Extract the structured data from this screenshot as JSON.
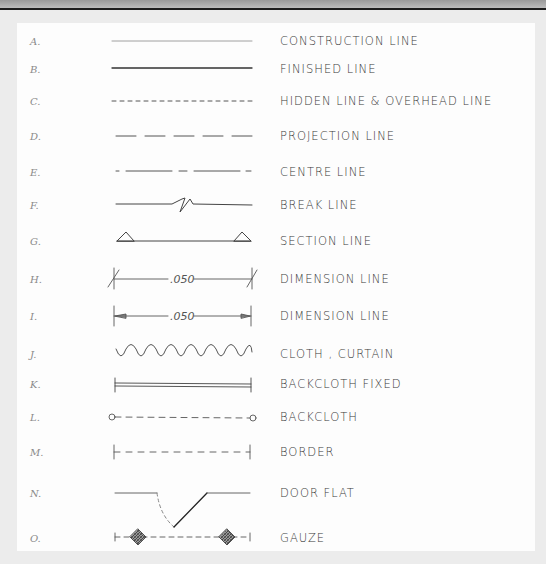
{
  "legend": {
    "rows": [
      {
        "letter": "A.",
        "label": "CONSTRUCTION LINE",
        "y": 41
      },
      {
        "letter": "B.",
        "label": "FINISHED LINE",
        "y": 69
      },
      {
        "letter": "C.",
        "label": "HIDDEN LINE & OVERHEAD LINE",
        "y": 101
      },
      {
        "letter": "D.",
        "label": "PROJECTION LINE",
        "y": 136
      },
      {
        "letter": "E.",
        "label": "CENTRE LINE",
        "y": 172
      },
      {
        "letter": "F.",
        "label": "BREAK LINE",
        "y": 205
      },
      {
        "letter": "G.",
        "label": "SECTION LINE",
        "y": 241
      },
      {
        "letter": "H.",
        "label": "DIMENSION LINE",
        "y": 279
      },
      {
        "letter": "I.",
        "label": "DIMENSION LINE",
        "y": 316
      },
      {
        "letter": "J.",
        "label": "CLOTH , CURTAIN",
        "y": 354
      },
      {
        "letter": "K.",
        "label": "BACKCLOTH FIXED",
        "y": 384
      },
      {
        "letter": "L.",
        "label": "BACKCLOTH",
        "y": 417
      },
      {
        "letter": "M.",
        "label": "BORDER",
        "y": 452
      },
      {
        "letter": "N.",
        "label": "DOOR FLAT",
        "y": 493
      },
      {
        "letter": "O.",
        "label": "GAUZE",
        "y": 538
      }
    ],
    "dimension_value_h": ".050",
    "dimension_value_i": ".050"
  },
  "colors": {
    "ink": "#3a3a3a",
    "paper": "#fdfdfd",
    "margin": "#ececec"
  }
}
